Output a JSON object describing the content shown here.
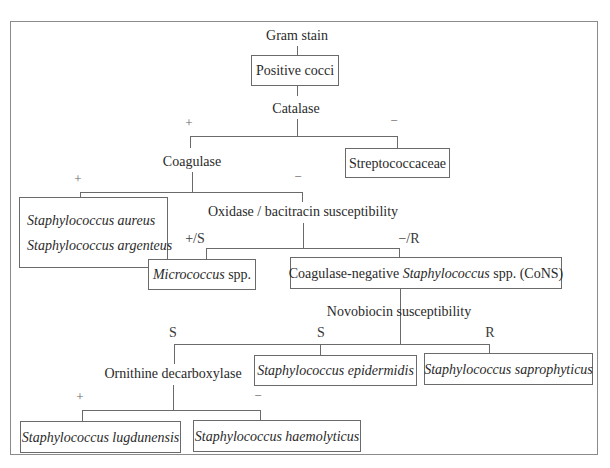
{
  "diagram": {
    "type": "identification-flowchart",
    "root_label": "Gram stain",
    "nodes": {
      "positive_cocci": "Positive cocci",
      "catalase": "Catalase",
      "coagulase": "Coagulase",
      "streptococcaceae": "Streptococcaceae",
      "s_aureus": "Staphylococcus aureus",
      "s_argenteus": "Staphylococcus argenteus",
      "oxidase": "Oxidase / bacitracin susceptibility",
      "micrococcus_genus": "Micrococcus",
      "micrococcus_suffix": " spp.",
      "cons_prefix": "Coagulase-negative ",
      "cons_genus": "Staphylococcus",
      "cons_suffix": " spp. (CoNS)",
      "novobiocin": "Novobiocin susceptibility",
      "ornithine": "Ornithine decarboxylase",
      "s_epidermidis": "Staphylococcus epidermidis",
      "s_saprophyticus": "Staphylococcus saprophyticus",
      "s_lugdunensis": "Staphylococcus lugdunensis",
      "s_haemolyticus": "Staphylococcus haemolyticus"
    },
    "edge_labels": {
      "catalase_pos": "+",
      "catalase_neg": "−",
      "coagulase_pos": "+",
      "coagulase_neg": "−",
      "oxidase_pos": "+/S",
      "oxidase_neg": "−/R",
      "novobiocin_s1": "S",
      "novobiocin_s2": "S",
      "novobiocin_r": "R",
      "ornithine_pos": "+",
      "ornithine_neg": "−"
    },
    "edges": [
      [
        "Gram stain",
        "Positive cocci"
      ],
      [
        "Positive cocci",
        "Catalase"
      ],
      [
        "Catalase",
        "Coagulase",
        "+"
      ],
      [
        "Catalase",
        "Streptococcaceae",
        "−"
      ],
      [
        "Coagulase",
        "Staphylococcus aureus / Staphylococcus argenteus",
        "+"
      ],
      [
        "Coagulase",
        "Oxidase / bacitracin susceptibility",
        "−"
      ],
      [
        "Oxidase / bacitracin susceptibility",
        "Micrococcus spp.",
        "+/S"
      ],
      [
        "Oxidase / bacitracin susceptibility",
        "Coagulase-negative Staphylococcus spp. (CoNS)",
        "−/R"
      ],
      [
        "Coagulase-negative Staphylococcus spp. (CoNS)",
        "Novobiocin susceptibility"
      ],
      [
        "Novobiocin susceptibility",
        "Ornithine decarboxylase",
        "S"
      ],
      [
        "Novobiocin susceptibility",
        "Staphylococcus epidermidis",
        "S"
      ],
      [
        "Novobiocin susceptibility",
        "Staphylococcus saprophyticus",
        "R"
      ],
      [
        "Ornithine decarboxylase",
        "Staphylococcus lugdunensis",
        "+"
      ],
      [
        "Ornithine decarboxylase",
        "Staphylococcus haemolyticus",
        "−"
      ]
    ]
  }
}
